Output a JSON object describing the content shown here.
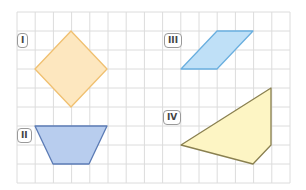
{
  "grid": {
    "x0": 17,
    "y0": 12,
    "cols": 15,
    "rows": 9,
    "cell_w": 18.2,
    "cell_h": 19,
    "line_color": "#dcdcdc"
  },
  "shapes": [
    {
      "id": "I",
      "label": "I",
      "kind": "square (rotated)",
      "fill": "#fde7bf",
      "stroke": "#f0c070",
      "points": [
        [
          71,
          31
        ],
        [
          107,
          69
        ],
        [
          71,
          107
        ],
        [
          35,
          69
        ]
      ],
      "label_pos": [
        17,
        33
      ]
    },
    {
      "id": "II",
      "label": "II",
      "kind": "trapezoid",
      "fill": "#b8cdee",
      "stroke": "#5b7bb5",
      "points": [
        [
          35,
          126
        ],
        [
          107,
          126
        ],
        [
          89,
          164
        ],
        [
          53,
          164
        ]
      ],
      "label_pos": [
        17,
        128
      ]
    },
    {
      "id": "III",
      "label": "III",
      "kind": "parallelogram",
      "fill": "#bfe0f7",
      "stroke": "#6aafdf",
      "points": [
        [
          217,
          31
        ],
        [
          253,
          31
        ],
        [
          217,
          69
        ],
        [
          181,
          69
        ]
      ],
      "label_pos": [
        164,
        33
      ]
    },
    {
      "id": "IV",
      "label": "IV",
      "kind": "quadrilateral",
      "fill": "#fdf5c4",
      "stroke": "#8a8050",
      "points": [
        [
          181,
          145
        ],
        [
          271,
          88
        ],
        [
          271,
          145
        ],
        [
          253,
          164
        ]
      ],
      "label_pos": [
        163,
        110
      ]
    }
  ]
}
